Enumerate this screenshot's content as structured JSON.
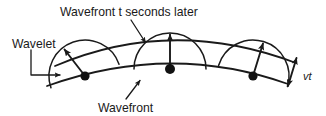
{
  "figure": {
    "title_label": "Wavefront t seconds later",
    "type": "huygens-principle-wavefront-diagram",
    "background_color": "#ffffff",
    "ink_color": "#1a1a1a",
    "labels": {
      "top": "Wavefront t seconds later",
      "left": "Wavelet",
      "bottom": "Wavefront",
      "right": "vt"
    },
    "geometry": {
      "lower_wavefront": {
        "description": "original wavefront arc",
        "start": [
          47,
          86
        ],
        "control": [
          170,
          42
        ],
        "end": [
          288,
          84
        ]
      },
      "upper_wavefront": {
        "description": "wavefront t seconds later",
        "start": [
          55,
          66
        ],
        "control": [
          172,
          16
        ],
        "end": [
          296,
          63
        ]
      },
      "source_points": [
        {
          "name": "left-source-point",
          "x": 85,
          "y": 76
        },
        {
          "name": "center-source-point",
          "x": 170,
          "y": 69
        },
        {
          "name": "right-source-point",
          "x": 253,
          "y": 76
        }
      ],
      "wavelets": [
        {
          "name": "left-wavelet",
          "center": [
            85,
            76
          ],
          "radius": 36,
          "rotation": -19
        },
        {
          "name": "center-wavelet",
          "center": [
            170,
            69
          ],
          "radius": 36,
          "rotation": 0
        },
        {
          "name": "right-wavelet",
          "center": [
            253,
            76
          ],
          "radius": 36,
          "rotation": 17
        }
      ],
      "radius_vectors": [
        {
          "name": "left-radius-vector",
          "from": [
            85,
            76
          ],
          "to": [
            63,
            48
          ]
        },
        {
          "name": "center-radius-vector",
          "from": [
            170,
            69
          ],
          "to": [
            170,
            33
          ]
        },
        {
          "name": "right-radius-vector",
          "from": [
            253,
            76
          ],
          "to": [
            264,
            42
          ]
        }
      ],
      "vt_measure": {
        "name": "vt-distance-arrow",
        "from": [
          287,
          88
        ],
        "to": [
          296,
          56
        ],
        "double_headed": true
      }
    },
    "leaders": [
      {
        "name": "top-label-leader",
        "path": "M 131 20 L 146 44",
        "arrowhead": "end"
      },
      {
        "name": "left-label-leader",
        "path": "M 31 50 L 31 75 L 62 75",
        "arrowhead": "end"
      },
      {
        "name": "bottom-label-leader",
        "path": "M 126 99 L 141 79",
        "arrowhead": "end"
      }
    ]
  }
}
